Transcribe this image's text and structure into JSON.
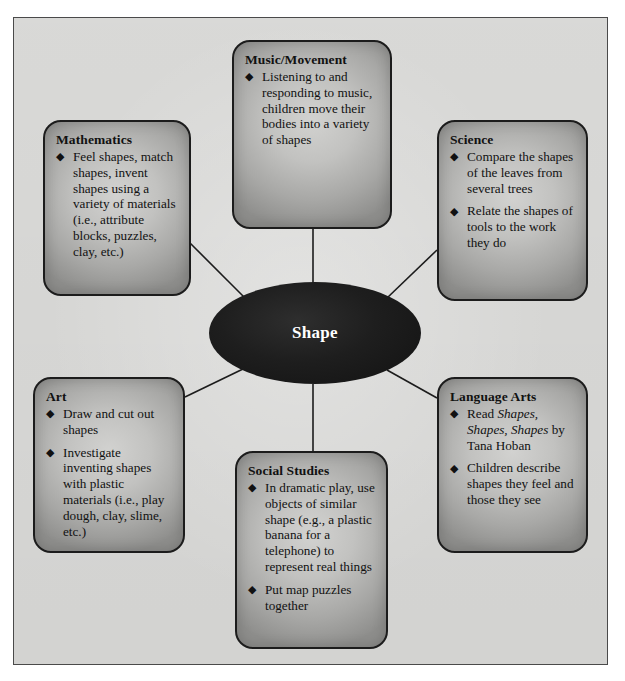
{
  "center": {
    "label": "Shape"
  },
  "bullet_glyph": "◆",
  "colors": {
    "page_background": "#ffffff",
    "frame_background": "#dcdcda",
    "frame_border": "#4a4a4a",
    "node_fill": "#c2c2c0",
    "node_border": "#1c1c1c",
    "center_fill": "#1e1e1e",
    "center_text": "#ffffff",
    "body_text": "#111111",
    "connector": "#1c1c1c"
  },
  "nodes": [
    {
      "id": "music",
      "title": "Music/Movement",
      "bullets": [
        "Listening to and responding to music, children move their bodies into a variety of shapes"
      ]
    },
    {
      "id": "mathematics",
      "title": "Mathematics",
      "bullets": [
        "Feel shapes, match shapes, invent shapes using a variety of materials (i.e., attribute blocks, puzzles, clay, etc.)"
      ]
    },
    {
      "id": "science",
      "title": "Science",
      "bullets": [
        "Compare the shapes of the leaves from several trees",
        "Relate the shapes of tools to the work they do"
      ]
    },
    {
      "id": "art",
      "title": "Art",
      "bullets": [
        "Draw and cut out shapes",
        "Investigate inventing shapes with plastic materials (i.e., play dough, clay, slime, etc.)"
      ]
    },
    {
      "id": "language-arts",
      "title": "Language Arts",
      "bullets": [
        "Children describe shapes they feel and those they see"
      ],
      "bullet_rich_first": {
        "prefix": "Read ",
        "italic": "Shapes, Shapes, Shapes",
        "suffix": " by Tana Hoban"
      }
    },
    {
      "id": "social-studies",
      "title": "Social Studies",
      "bullets": [
        "In dramatic play, use objects of similar shape (e.g., a plastic banana for a telephone) to represent real things",
        "Put map puzzles together"
      ]
    }
  ]
}
